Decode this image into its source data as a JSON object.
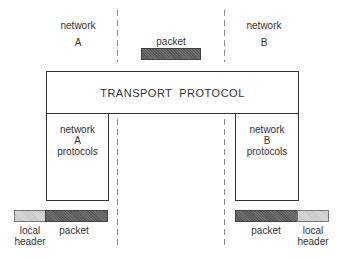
{
  "diagram": {
    "networks": {
      "a": {
        "line1": "network",
        "line2": "A"
      },
      "b": {
        "line1": "network",
        "line2": "B"
      }
    },
    "top_packet_label": "packet",
    "transport_box": {
      "label": "TRANSPORT  PROTOCOL"
    },
    "protocol_boxes": {
      "a": {
        "line1": "network",
        "line2": "A",
        "line3": "protocols"
      },
      "b": {
        "line1": "network",
        "line2": "B",
        "line3": "protocols"
      }
    },
    "frames": {
      "left": {
        "header": {
          "line1": "local",
          "line2": "header"
        },
        "packet": "packet"
      },
      "right": {
        "packet": "packet",
        "header": {
          "line1": "local",
          "line2": "header"
        }
      }
    },
    "colors": {
      "packet_fill": "#636363",
      "header_fill": "#d0d0d0",
      "border": "#333333",
      "divider": "#8a8a8a"
    }
  }
}
